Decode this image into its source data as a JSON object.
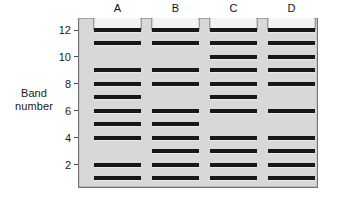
{
  "figure": {
    "kind": "gel-electrophoresis-diagram",
    "axis_label_line1": "Band",
    "axis_label_line2": "number"
  },
  "ruler": {
    "ticks": [
      {
        "label": "12",
        "value": 12
      },
      {
        "label": "10",
        "value": 10
      },
      {
        "label": "8",
        "value": 8
      },
      {
        "label": "6",
        "value": 6
      },
      {
        "label": "4",
        "value": 4
      },
      {
        "label": "2",
        "value": 2
      }
    ],
    "min": 1,
    "max": 12
  },
  "colors": {
    "gel_fill": "#d8d8d8",
    "gel_fill_light": "#e2e2e2",
    "gel_outline": "#6f6f6f",
    "band": "#171717",
    "well_fill": "#f2f2f2",
    "page_background": "#ffffff",
    "text": "#1a1a1a"
  },
  "chart_data": {
    "type": "table",
    "title": "",
    "xlabel": "",
    "ylabel": "Band number",
    "ylim": [
      1,
      12
    ],
    "categories": [
      "A",
      "B",
      "C",
      "D"
    ],
    "band_numbers": [
      1,
      2,
      3,
      4,
      5,
      6,
      7,
      8,
      9,
      10,
      11,
      12
    ],
    "series": [
      {
        "name": "A",
        "bands": [
          1,
          2,
          4,
          5,
          6,
          7,
          8,
          9,
          11,
          12
        ],
        "count": 10
      },
      {
        "name": "B",
        "bands": [
          1,
          2,
          3,
          4,
          5,
          6,
          8,
          9,
          11,
          12
        ],
        "count": 10
      },
      {
        "name": "C",
        "bands": [
          1,
          2,
          3,
          4,
          6,
          7,
          8,
          9,
          10,
          11,
          12
        ],
        "count": 11
      },
      {
        "name": "D",
        "bands": [
          1,
          2,
          3,
          4,
          6,
          8,
          9,
          10,
          11,
          12
        ],
        "count": 10
      }
    ]
  },
  "lanes": [
    {
      "label": "A",
      "bands": [
        1,
        2,
        4,
        5,
        6,
        7,
        8,
        9,
        11,
        12
      ]
    },
    {
      "label": "B",
      "bands": [
        1,
        2,
        3,
        4,
        5,
        6,
        8,
        9,
        11,
        12
      ]
    },
    {
      "label": "C",
      "bands": [
        1,
        2,
        3,
        4,
        6,
        7,
        8,
        9,
        10,
        11,
        12
      ]
    },
    {
      "label": "D",
      "bands": [
        1,
        2,
        3,
        4,
        6,
        8,
        9,
        10,
        11,
        12
      ]
    }
  ]
}
